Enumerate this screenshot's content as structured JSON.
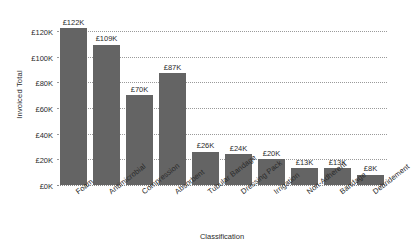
{
  "chart_data": {
    "type": "bar",
    "title": "",
    "xlabel": "Classification",
    "ylabel": "Invoiced Total",
    "categories": [
      "Foam",
      "Antimicrobial",
      "Compression",
      "Absorbent",
      "Tubular Bandage",
      "Dressing Pack",
      "Irrigation",
      "Non-Adherent",
      "Bandage",
      "Debridement"
    ],
    "values": [
      122000,
      109000,
      70000,
      87000,
      26000,
      24000,
      20000,
      13000,
      13000,
      8000
    ],
    "value_labels": [
      "£122K",
      "£109K",
      "£70K",
      "£87K",
      "£26K",
      "£24K",
      "£20K",
      "£13K",
      "£13K",
      "£8K"
    ],
    "ylim": [
      0,
      130000
    ],
    "y_ticks": [
      0,
      20000,
      40000,
      60000,
      80000,
      100000,
      120000
    ],
    "y_tick_labels": [
      "£0K",
      "£20K",
      "£40K",
      "£60K",
      "£80K",
      "£100K",
      "£120K"
    ],
    "grid": true,
    "grid_axis": "y",
    "legend": false,
    "bar_color": "#646464",
    "grid_color": "#9a9a9a",
    "background_color": "#ffffff"
  }
}
